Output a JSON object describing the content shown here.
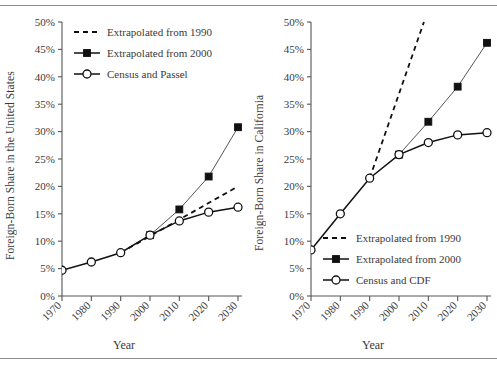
{
  "figure": {
    "panels": [
      {
        "id": "us",
        "ylabel": "Foreign-Born Share in the United States",
        "xlabel": "Year",
        "legend": [
          "Extrapolated from 1990",
          "Extrapolated from 2000",
          "Census and Passel"
        ],
        "legend_position": "top-left",
        "yticks": [
          "0%",
          "5%",
          "10%",
          "15%",
          "20%",
          "25%",
          "30%",
          "35%",
          "40%",
          "45%",
          "50%"
        ],
        "xticks": [
          "1970",
          "1980",
          "1990",
          "2000",
          "2010",
          "2020",
          "2030"
        ]
      },
      {
        "id": "ca",
        "ylabel": "Foreign-Born Share in California",
        "xlabel": "Year",
        "legend": [
          "Extrapolated from 1990",
          "Extrapolated from 2000",
          "Census and CDF"
        ],
        "legend_position": "bottom-right",
        "yticks": [
          "0%",
          "5%",
          "10%",
          "15%",
          "20%",
          "25%",
          "30%",
          "35%",
          "40%",
          "45%",
          "50%"
        ],
        "xticks": [
          "1970",
          "1980",
          "1990",
          "2000",
          "2010",
          "2020",
          "2030"
        ]
      }
    ]
  },
  "chart_data": [
    {
      "type": "line",
      "id": "us",
      "title": "",
      "xlabel": "Year",
      "ylabel": "Foreign-Born Share in the United States",
      "xlim": [
        1970,
        2030
      ],
      "ylim": [
        0,
        50
      ],
      "yunit": "percent",
      "grid": false,
      "legend_position": "top-left",
      "xticks": [
        1970,
        1980,
        1990,
        2000,
        2010,
        2020,
        2030
      ],
      "yticks": [
        0,
        5,
        10,
        15,
        20,
        25,
        30,
        35,
        40,
        45,
        50
      ],
      "series": [
        {
          "name": "Census and Passel",
          "marker": "open-circle",
          "line": "solid",
          "x": [
            1970,
            1980,
            1990,
            2000,
            2010,
            2020,
            2030
          ],
          "values": [
            4.7,
            6.2,
            7.9,
            11.1,
            13.7,
            15.3,
            16.2
          ]
        },
        {
          "name": "Extrapolated from 2000",
          "marker": "filled-square",
          "line": "solid",
          "x": [
            2000,
            2010,
            2020,
            2030
          ],
          "values": [
            11.1,
            15.8,
            21.8,
            30.8
          ]
        },
        {
          "name": "Extrapolated from 1990",
          "marker": "none",
          "line": "dashed",
          "x": [
            1990,
            2030
          ],
          "values": [
            7.9,
            20.0
          ]
        }
      ]
    },
    {
      "type": "line",
      "id": "ca",
      "title": "",
      "xlabel": "Year",
      "ylabel": "Foreign-Born Share in California",
      "xlim": [
        1970,
        2030
      ],
      "ylim": [
        0,
        50
      ],
      "yunit": "percent",
      "grid": false,
      "legend_position": "bottom-right",
      "xticks": [
        1970,
        1980,
        1990,
        2000,
        2010,
        2020,
        2030
      ],
      "yticks": [
        0,
        5,
        10,
        15,
        20,
        25,
        30,
        35,
        40,
        45,
        50
      ],
      "series": [
        {
          "name": "Census and CDF",
          "marker": "open-circle",
          "line": "solid",
          "x": [
            1970,
            1980,
            1990,
            2000,
            2010,
            2020,
            2030
          ],
          "values": [
            8.4,
            15.0,
            21.5,
            25.8,
            28.0,
            29.4,
            29.8
          ]
        },
        {
          "name": "Extrapolated from 2000",
          "marker": "filled-square",
          "line": "solid",
          "x": [
            2000,
            2010,
            2020,
            2030
          ],
          "values": [
            25.8,
            31.8,
            38.2,
            46.2
          ]
        },
        {
          "name": "Extrapolated from 1990",
          "marker": "none",
          "line": "dashed",
          "x": [
            1990,
            2008.5
          ],
          "values": [
            21.5,
            50.0
          ]
        }
      ]
    }
  ]
}
